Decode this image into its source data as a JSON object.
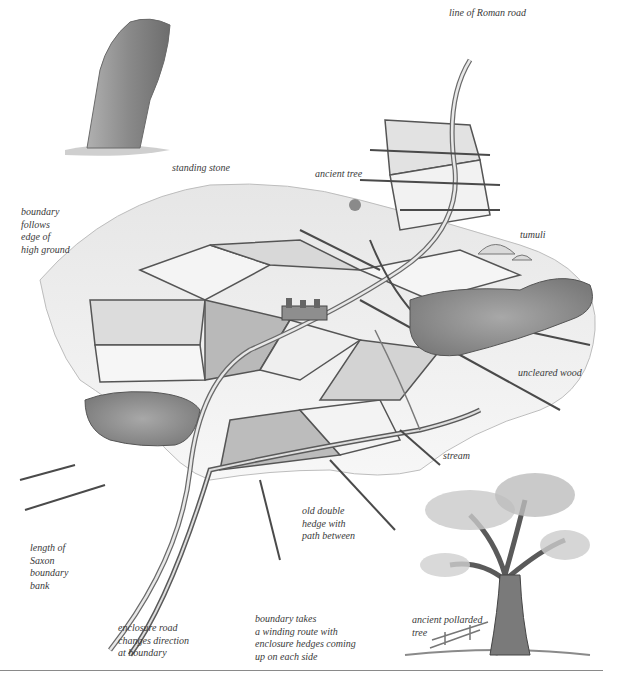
{
  "figure": {
    "type": "illustrated landscape diagram",
    "theme": "historic field boundaries, hedges and roads",
    "colors": {
      "ink": "#3a3a3a",
      "field_light": "#f2f2f2",
      "field_mid": "#d6d6d6",
      "field_dark": "#b8b8b8",
      "wood": "#8c8c8c",
      "rule": "#8a8a8a"
    }
  },
  "labels": {
    "roman_road": "line of Roman road",
    "standing_stone": "standing stone",
    "ancient_tree": "ancient tree",
    "boundary_high_ground": "boundary\nfollows\nedge of\nhigh ground",
    "tumuli": "tumuli",
    "uncleared_wood": "uncleared wood",
    "stream": "stream",
    "double_hedge": "old double\nhedge with\npath between",
    "saxon_bank": "length of\nSaxon\nboundary\nbank",
    "enclosure_road": "enclosure road\nchanges direction\nat boundary",
    "winding_boundary": "boundary takes\na winding route with\nenclosure hedges coming\nup on each side",
    "pollarded_tree": "ancient pollarded\ntree"
  }
}
